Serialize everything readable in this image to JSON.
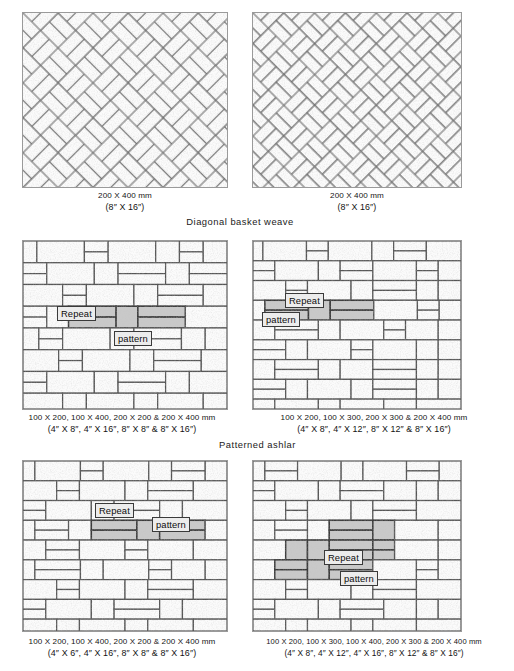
{
  "figure": {
    "title_visible": false,
    "background": "#ffffff",
    "line_color": "#5a5a5a",
    "fill_color": "#fafafa",
    "highlight_color": "#c9c9c9",
    "chip_bg": "#ececec"
  },
  "sections": [
    {
      "id": "diagonal-basket-weave",
      "label": "Diagonal basket weave"
    },
    {
      "id": "patterned-ashlar",
      "label": "Patterned ashlar"
    }
  ],
  "panels": [
    {
      "id": "diagonal-herringbone",
      "position": "top-left",
      "pattern": "diagonal herringbone",
      "caption_metric": "200 X 400 mm",
      "caption_imperial": "(8″ X 16″)",
      "callout": null
    },
    {
      "id": "diagonal-basket-weave",
      "position": "top-right",
      "pattern": "diagonal basket weave",
      "caption_metric": "200 X 400 mm",
      "caption_imperial": "(8″ X 16″)",
      "callout": null
    },
    {
      "id": "patterned-ashlar-a",
      "position": "middle-left",
      "pattern": "patterned ashlar",
      "caption_metric": "100 X 200, 100 X 400, 200 X 200 & 200 X 400 mm",
      "caption_imperial": "(4″ X 8″, 4″ X 16″, 8″ X 8″ & 8″ X 16″)",
      "callout": {
        "word1": "Repeat",
        "word2": "pattern"
      }
    },
    {
      "id": "patterned-ashlar-b",
      "position": "middle-right",
      "pattern": "patterned ashlar",
      "caption_metric": "100 X 200, 100 X 300, 200 X 300 & 200 X 400 mm",
      "caption_imperial": "(4″ X 8″, 4″ X 12″, 8″ X 12″ & 8″ X 16″)",
      "callout": {
        "word1": "Repeat",
        "word2": "pattern"
      }
    },
    {
      "id": "patterned-ashlar-c",
      "position": "bottom-left",
      "pattern": "patterned ashlar",
      "caption_metric": "100 X 200, 100 X 400, 200 X 200 & 200 X 400 mm",
      "caption_imperial": "(4″ X 6″, 4″ X 16″, 8″ X 8″ & 8″ X 16″)",
      "callout": {
        "word1": "Repeat",
        "word2": "pattern"
      }
    },
    {
      "id": "patterned-ashlar-d",
      "position": "bottom-right",
      "pattern": "patterned ashlar",
      "caption_metric": "100 X 200, 100 X 300, 100 X 400, 200 X 300 & 200 X 400 mm",
      "caption_imperial": "(4″ X 8″, 4″ X 12″, 4″ X 16″, 8″ X 12″ & 8″ X 16″)",
      "callout": {
        "word1": "Repeat",
        "word2": "pattern"
      }
    }
  ]
}
